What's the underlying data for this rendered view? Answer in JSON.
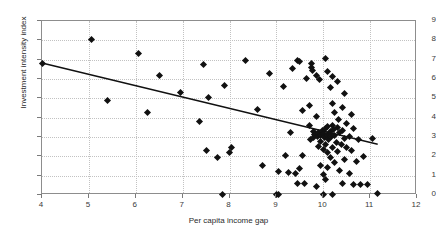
{
  "chart_data": {
    "type": "scatter",
    "title": "",
    "xlabel": "Per capita income gap",
    "ylabel": "Investment intensity index",
    "xlim": [
      4,
      12
    ],
    "ylim": [
      0,
      9
    ],
    "xticks": [
      4,
      5,
      6,
      7,
      8,
      9,
      10,
      11,
      12
    ],
    "yticks": [
      0,
      1,
      2,
      3,
      4,
      5,
      6,
      7,
      8,
      9
    ],
    "grid": true,
    "legend": null,
    "marker": "diamond",
    "marker_color": "#111111",
    "frame_color": "#8d8d8d",
    "grid_color": "#c2c2c2",
    "trendline": {
      "label": "linear fit",
      "color": "#111111",
      "x0": 4.0,
      "y0": 6.8,
      "x1": 11.2,
      "y1": 2.55
    },
    "points": [
      [
        4.0,
        6.8
      ],
      [
        5.05,
        8.05
      ],
      [
        5.4,
        4.88
      ],
      [
        6.05,
        7.3
      ],
      [
        6.25,
        4.28
      ],
      [
        6.5,
        6.2
      ],
      [
        6.95,
        5.3
      ],
      [
        7.35,
        3.8
      ],
      [
        7.45,
        6.75
      ],
      [
        7.5,
        2.3
      ],
      [
        7.55,
        5.05
      ],
      [
        7.75,
        1.95
      ],
      [
        7.85,
        0.05
      ],
      [
        7.9,
        5.65
      ],
      [
        8.0,
        2.18
      ],
      [
        8.05,
        2.48
      ],
      [
        8.35,
        6.98
      ],
      [
        8.6,
        4.42
      ],
      [
        8.7,
        1.55
      ],
      [
        8.85,
        6.28
      ],
      [
        9.0,
        0.05
      ],
      [
        9.05,
        0.05
      ],
      [
        9.05,
        1.2
      ],
      [
        9.15,
        5.6
      ],
      [
        9.2,
        2.05
      ],
      [
        9.25,
        1.18
      ],
      [
        9.3,
        3.25
      ],
      [
        9.35,
        6.55
      ],
      [
        9.4,
        1.12
      ],
      [
        9.45,
        6.95
      ],
      [
        9.45,
        0.6
      ],
      [
        9.5,
        6.92
      ],
      [
        9.5,
        1.35
      ],
      [
        9.55,
        4.35
      ],
      [
        9.55,
        2.05
      ],
      [
        9.6,
        0.62
      ],
      [
        9.65,
        6.05
      ],
      [
        9.7,
        4.62
      ],
      [
        9.7,
        3.6
      ],
      [
        9.72,
        2.88
      ],
      [
        9.75,
        6.78
      ],
      [
        9.75,
        6.62
      ],
      [
        9.78,
        6.45
      ],
      [
        9.8,
        3.3
      ],
      [
        9.8,
        2.95
      ],
      [
        9.82,
        3.15
      ],
      [
        9.85,
        6.2
      ],
      [
        9.85,
        4.05
      ],
      [
        9.85,
        0.45
      ],
      [
        9.88,
        3.05
      ],
      [
        9.9,
        3.22
      ],
      [
        9.9,
        2.52
      ],
      [
        9.92,
        5.98
      ],
      [
        9.95,
        3.1
      ],
      [
        9.95,
        2.75
      ],
      [
        9.95,
        1.55
      ],
      [
        9.98,
        3.35
      ],
      [
        10.0,
        0.05
      ],
      [
        10.0,
        3.18
      ],
      [
        10.0,
        2.35
      ],
      [
        10.0,
        1.05
      ],
      [
        10.02,
        2.98
      ],
      [
        10.05,
        7.05
      ],
      [
        10.05,
        3.42
      ],
      [
        10.05,
        2.62
      ],
      [
        10.05,
        0.78
      ],
      [
        10.08,
        3.12
      ],
      [
        10.1,
        6.4
      ],
      [
        10.1,
        3.55
      ],
      [
        10.1,
        2.18
      ],
      [
        10.1,
        1.42
      ],
      [
        10.12,
        2.88
      ],
      [
        10.15,
        5.55
      ],
      [
        10.15,
        3.28
      ],
      [
        10.15,
        1.92
      ],
      [
        10.18,
        3.02
      ],
      [
        10.2,
        6.15
      ],
      [
        10.2,
        4.72
      ],
      [
        10.2,
        3.62
      ],
      [
        10.2,
        2.45
      ],
      [
        10.2,
        0.05
      ],
      [
        10.22,
        3.38
      ],
      [
        10.25,
        4.28
      ],
      [
        10.25,
        3.08
      ],
      [
        10.25,
        1.68
      ],
      [
        10.28,
        2.72
      ],
      [
        10.3,
        5.85
      ],
      [
        10.3,
        3.48
      ],
      [
        10.3,
        2.25
      ],
      [
        10.32,
        3.92
      ],
      [
        10.35,
        3.25
      ],
      [
        10.35,
        1.25
      ],
      [
        10.38,
        2.6
      ],
      [
        10.4,
        4.55
      ],
      [
        10.4,
        3.35
      ],
      [
        10.4,
        0.58
      ],
      [
        10.45,
        5.25
      ],
      [
        10.45,
        2.9
      ],
      [
        10.45,
        1.85
      ],
      [
        10.5,
        3.72
      ],
      [
        10.5,
        2.45
      ],
      [
        10.55,
        3.05
      ],
      [
        10.55,
        1.1
      ],
      [
        10.6,
        4.18
      ],
      [
        10.6,
        2.28
      ],
      [
        10.65,
        3.42
      ],
      [
        10.65,
        0.52
      ],
      [
        10.7,
        1.72
      ],
      [
        10.75,
        2.85
      ],
      [
        10.8,
        0.55
      ],
      [
        10.85,
        1.98
      ],
      [
        10.95,
        0.52
      ],
      [
        11.05,
        2.92
      ],
      [
        11.15,
        0.08
      ]
    ]
  }
}
